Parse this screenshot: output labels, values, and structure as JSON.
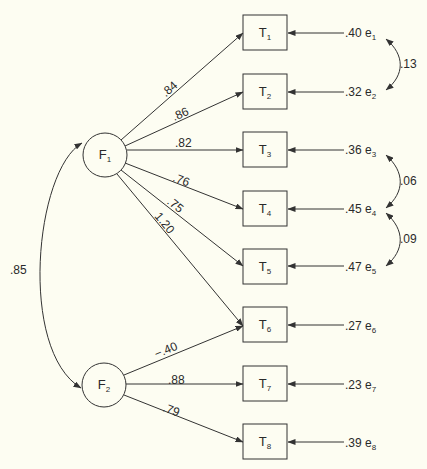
{
  "colors": {
    "background": "#fdfdf2",
    "stroke": "#333333",
    "text": "#2a2a2a"
  },
  "factors": [
    {
      "id": "F1",
      "label": "F",
      "sub": "1"
    },
    {
      "id": "F2",
      "label": "F",
      "sub": "2"
    }
  ],
  "indicators": [
    {
      "id": "T1",
      "label": "T",
      "sub": "1",
      "error": {
        "value": ".40",
        "name": "e",
        "sub": "1"
      }
    },
    {
      "id": "T2",
      "label": "T",
      "sub": "2",
      "error": {
        "value": ".32",
        "name": "e",
        "sub": "2"
      }
    },
    {
      "id": "T3",
      "label": "T",
      "sub": "3",
      "error": {
        "value": ".36",
        "name": "e",
        "sub": "3"
      }
    },
    {
      "id": "T4",
      "label": "T",
      "sub": "4",
      "error": {
        "value": ".45",
        "name": "e",
        "sub": "4"
      }
    },
    {
      "id": "T5",
      "label": "T",
      "sub": "5",
      "error": {
        "value": ".47",
        "name": "e",
        "sub": "5"
      }
    },
    {
      "id": "T6",
      "label": "T",
      "sub": "6",
      "error": {
        "value": ".27",
        "name": "e",
        "sub": "6"
      }
    },
    {
      "id": "T7",
      "label": "T",
      "sub": "7",
      "error": {
        "value": ".23",
        "name": "e",
        "sub": "7"
      }
    },
    {
      "id": "T8",
      "label": "T",
      "sub": "8",
      "error": {
        "value": ".39",
        "name": "e",
        "sub": "8"
      }
    }
  ],
  "loadings": [
    {
      "from": "F1",
      "to": "T1",
      "value": ".84"
    },
    {
      "from": "F1",
      "to": "T2",
      "value": ".86"
    },
    {
      "from": "F1",
      "to": "T3",
      "value": ".82"
    },
    {
      "from": "F1",
      "to": "T4",
      "value": ".76"
    },
    {
      "from": "F1",
      "to": "T5",
      "value": ".75"
    },
    {
      "from": "F1",
      "to": "T6",
      "value": "1.20"
    },
    {
      "from": "F2",
      "to": "T6",
      "value": "−.40"
    },
    {
      "from": "F2",
      "to": "T7",
      "value": ".88"
    },
    {
      "from": "F2",
      "to": "T8",
      "value": ".79"
    }
  ],
  "factor_correlation": {
    "between": [
      "F1",
      "F2"
    ],
    "value": ".85"
  },
  "error_covariances": [
    {
      "between": [
        "e1",
        "e2"
      ],
      "value": ".13"
    },
    {
      "between": [
        "e3",
        "e4"
      ],
      "value": ".06"
    },
    {
      "between": [
        "e4",
        "e5"
      ],
      "value": ".09"
    }
  ]
}
